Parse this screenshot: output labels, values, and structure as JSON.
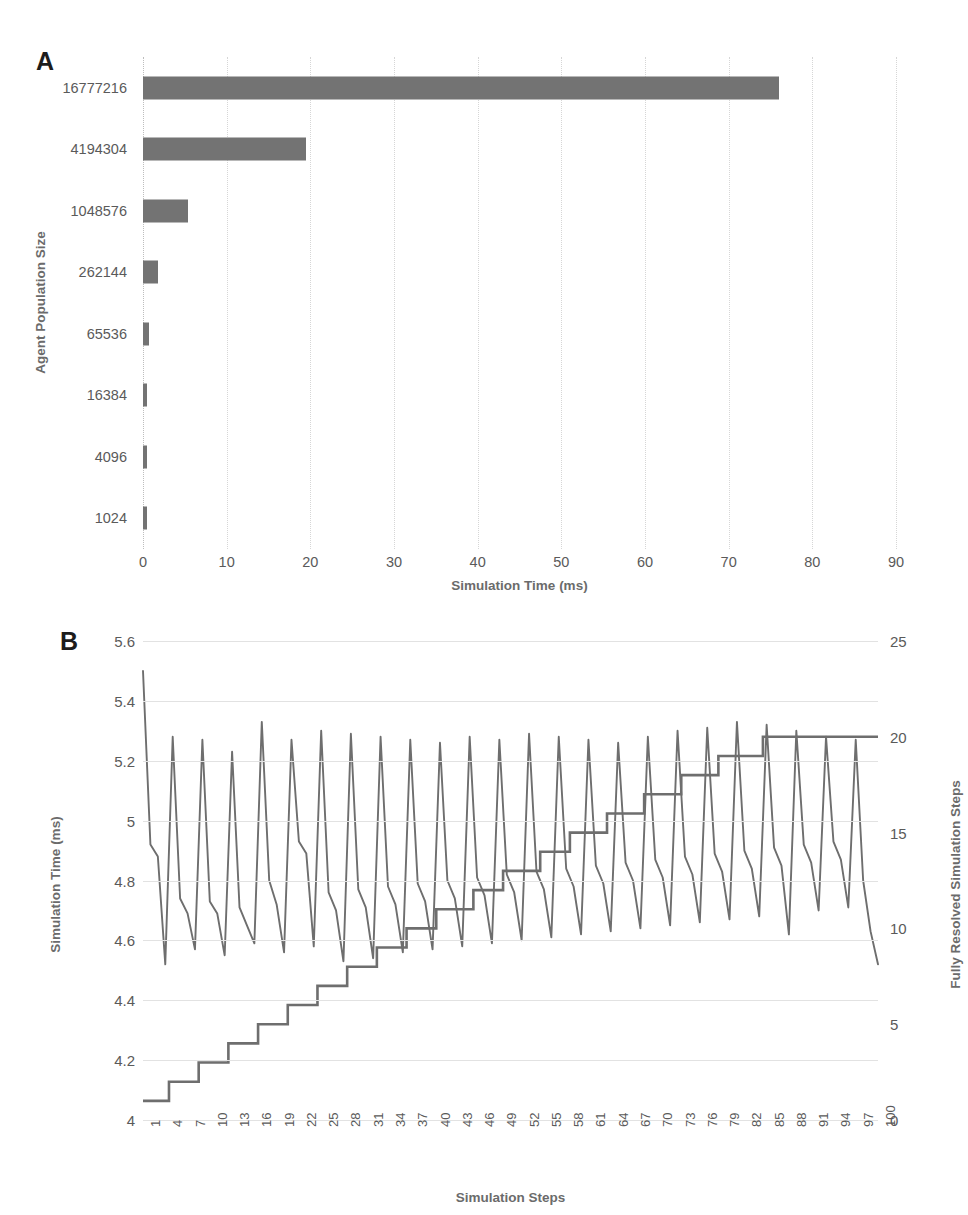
{
  "figure": {
    "panel_a_letter": "A",
    "panel_b_letter": "B"
  },
  "chart_data": [
    {
      "type": "bar",
      "panel": "A",
      "orientation": "horizontal",
      "title": "",
      "xlabel": "Simulation Time (ms)",
      "ylabel": "Agent Population Size",
      "categories": [
        "16777216",
        "4194304",
        "1048576",
        "262144",
        "65536",
        "16384",
        "4096",
        "1024"
      ],
      "values": [
        76.0,
        19.5,
        5.4,
        1.8,
        0.75,
        0.5,
        0.45,
        0.42
      ],
      "xlim": [
        0,
        90
      ],
      "xticks": [
        0,
        10,
        20,
        30,
        40,
        50,
        60,
        70,
        80,
        90
      ],
      "grid": "vertical",
      "bar_color": "#737373",
      "legend": "none"
    },
    {
      "type": "line",
      "panel": "B",
      "title": "",
      "xlabel": "Simulation Steps",
      "ylabel": "Simulation Time (ms)",
      "y2label": "Fully Resolved Simulation Steps",
      "ylim": [
        4,
        5.6
      ],
      "yticks": [
        4,
        4.2,
        4.4,
        4.6,
        4.8,
        5,
        5.2,
        5.4,
        5.6
      ],
      "y2lim": [
        0,
        25
      ],
      "y2ticks": [
        0,
        5,
        10,
        15,
        20,
        25
      ],
      "xlim": [
        1,
        100
      ],
      "xticks": [
        1,
        4,
        7,
        10,
        13,
        16,
        19,
        22,
        25,
        28,
        31,
        34,
        37,
        40,
        43,
        46,
        49,
        52,
        55,
        58,
        61,
        64,
        67,
        70,
        73,
        76,
        79,
        82,
        85,
        88,
        91,
        94,
        97,
        100
      ],
      "grid": "horizontal",
      "legend": "none",
      "series": [
        {
          "name": "Simulation Time (ms)",
          "axis": "left",
          "color": "#6e6e6e",
          "values": [
            5.5,
            4.92,
            4.88,
            4.52,
            5.28,
            4.74,
            4.69,
            4.57,
            5.27,
            4.73,
            4.69,
            4.55,
            5.23,
            4.71,
            4.65,
            4.59,
            5.33,
            4.8,
            4.72,
            4.56,
            5.27,
            4.93,
            4.89,
            4.58,
            5.3,
            4.76,
            4.7,
            4.53,
            5.29,
            4.77,
            4.71,
            4.54,
            5.28,
            4.78,
            4.72,
            4.56,
            5.27,
            4.79,
            4.73,
            4.57,
            5.26,
            4.8,
            4.74,
            4.58,
            5.28,
            4.81,
            4.75,
            4.59,
            5.27,
            4.82,
            4.76,
            4.6,
            5.29,
            4.83,
            4.77,
            4.61,
            5.28,
            4.84,
            4.78,
            4.62,
            5.27,
            4.85,
            4.79,
            4.63,
            5.26,
            4.86,
            4.8,
            4.64,
            5.28,
            4.87,
            4.81,
            4.65,
            5.3,
            4.88,
            4.82,
            4.66,
            5.31,
            4.89,
            4.83,
            4.67,
            5.33,
            4.9,
            4.84,
            4.68,
            5.32,
            4.91,
            4.85,
            4.62,
            5.3,
            4.92,
            4.86,
            4.7,
            5.28,
            4.93,
            4.87,
            4.71,
            5.27,
            4.8,
            4.63,
            4.52
          ]
        },
        {
          "name": "Fully Resolved Simulation Steps",
          "axis": "right",
          "color": "#6e6e6e",
          "values": [
            1,
            1,
            1,
            1,
            2,
            2,
            2,
            2,
            3,
            3,
            3,
            3,
            4,
            4,
            4,
            4,
            5,
            5,
            5,
            5,
            6,
            6,
            6,
            6,
            7,
            7,
            7,
            7,
            8,
            8,
            8,
            8,
            9,
            9,
            9,
            9,
            10,
            10,
            10,
            10,
            11,
            11,
            11,
            11,
            11,
            12,
            12,
            12,
            12,
            13,
            13,
            13,
            13,
            13,
            14,
            14,
            14,
            14,
            15,
            15,
            15,
            15,
            15,
            16,
            16,
            16,
            16,
            16,
            17,
            17,
            17,
            17,
            17,
            18,
            18,
            18,
            18,
            18,
            19,
            19,
            19,
            19,
            19,
            19,
            20,
            20,
            20,
            20,
            20,
            20,
            20,
            20,
            20,
            20,
            20,
            20,
            20,
            20,
            20,
            20
          ]
        }
      ]
    }
  ]
}
